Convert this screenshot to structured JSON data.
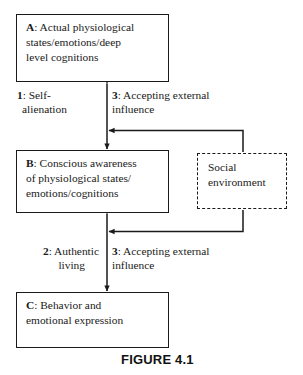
{
  "figure": {
    "caption": "FIGURE 4.1",
    "ink_color": "#1a1a1a",
    "background_color": "#ffffff"
  },
  "boxes": {
    "a": {
      "lead": "A",
      "line1_rest": ": Actual physiological",
      "line2": "states/emotions/deep",
      "line3": "level cognitions"
    },
    "b": {
      "lead": "B",
      "line1_rest": ": Conscious awareness",
      "line2": "of physiological states/",
      "line3": "emotions/cognitions"
    },
    "c": {
      "lead": "C",
      "line1_rest": ": Behavior and",
      "line2": "emotional expression"
    },
    "social": {
      "line1": "Social",
      "line2": "environment"
    }
  },
  "labels": {
    "one": {
      "lead": "1",
      "line1_rest": ": Self-",
      "line2": "alienation"
    },
    "two": {
      "lead": "2",
      "line1_rest": ": Authentic",
      "line2": "living"
    },
    "three_upper": {
      "lead": "3",
      "line1_rest": ": Accepting external",
      "line2": "influence"
    },
    "three_lower": {
      "lead": "3",
      "line1_rest": ": Accepting external",
      "line2": "influence"
    }
  }
}
